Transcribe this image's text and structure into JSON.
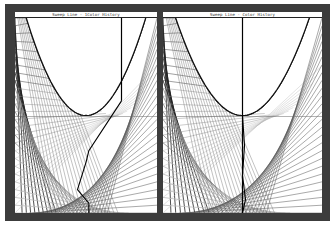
{
  "window": {
    "panels": [
      {
        "id": "left",
        "title": "Sweep Line - 1Color History",
        "sweep_line_position": 0.75,
        "history_mode": "staircase"
      },
      {
        "id": "right",
        "title": "Sweep Line - Color History",
        "sweep_line_position": 0.5,
        "history_mode": "vertical"
      }
    ],
    "colors": {
      "frame": "#3c3c3c",
      "background": "#ffffff",
      "ray_dark": "#222222",
      "ray_gray": "#8a8a8a",
      "ray_light": "#bdbdbd",
      "history_path": "#000000"
    }
  }
}
